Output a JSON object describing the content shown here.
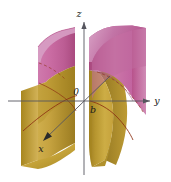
{
  "figure": {
    "name": "hyperbolic-cylinder-3d-plot",
    "caption": "",
    "background_color": "#ffffff",
    "axes": {
      "z": {
        "label": "z",
        "direction": "up"
      },
      "y": {
        "label": "y",
        "direction": "right"
      },
      "x": {
        "label": "x",
        "direction": "down-left"
      },
      "origin_label": "0",
      "axis_color": "#4a4a52"
    },
    "markers": [
      {
        "label": "b",
        "axis": "y",
        "description": "vertex of right branch on y-axis"
      }
    ],
    "surface": {
      "type": "hyperbolic-cylinder",
      "sheets": 2,
      "top_color": "#c0619b",
      "top_color_light": "#d793bd",
      "top_color_dark": "#a64a80",
      "bottom_color": "#c9a43c",
      "bottom_color_light": "#d9bb5e",
      "bottom_color_dark": "#9e7d23",
      "trace_curve_color": "#8a2d10"
    }
  }
}
